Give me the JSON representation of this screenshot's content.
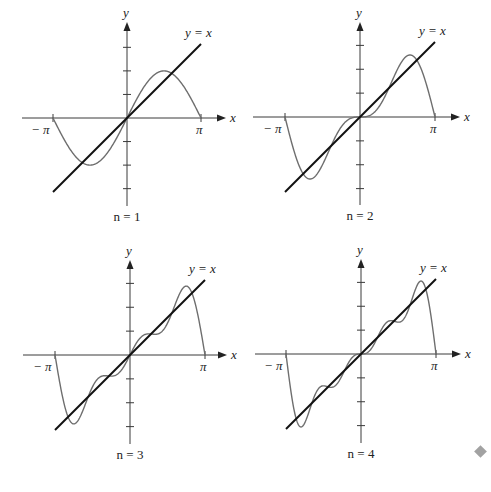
{
  "chart_data": [
    {
      "type": "line",
      "title": "n = 1",
      "n": 1,
      "xlabel": "x",
      "ylabel": "y",
      "x_tick_labels": [
        "−π",
        "π"
      ],
      "xlim": [
        -3.14159,
        3.14159
      ],
      "y_ticks": [
        -3,
        -2,
        -1,
        1,
        2,
        3
      ],
      "series": [
        {
          "name": "Fourier partial sum S_1(x) = 2 sin x",
          "terms": 1,
          "color": "#6e6e6e"
        },
        {
          "name": "y = x",
          "label": "y = x",
          "color": "#111111"
        }
      ],
      "annotations": [
        "y = x"
      ],
      "grid": false
    },
    {
      "type": "line",
      "title": "n = 2",
      "n": 2,
      "xlabel": "x",
      "ylabel": "y",
      "x_tick_labels": [
        "−π",
        "π"
      ],
      "xlim": [
        -3.14159,
        3.14159
      ],
      "y_ticks": [
        -3,
        -2,
        -1,
        1,
        2,
        3
      ],
      "series": [
        {
          "name": "Fourier partial sum S_2(x) = 2(sin x − sin 2x/2)",
          "terms": 2,
          "color": "#6e6e6e"
        },
        {
          "name": "y = x",
          "label": "y = x",
          "color": "#111111"
        }
      ],
      "annotations": [
        "y = x"
      ],
      "grid": false
    },
    {
      "type": "line",
      "title": "n = 3",
      "n": 3,
      "xlabel": "x",
      "ylabel": "y",
      "x_tick_labels": [
        "−π",
        "π"
      ],
      "xlim": [
        -3.14159,
        3.14159
      ],
      "y_ticks": [
        -3,
        -2,
        -1,
        1,
        2,
        3
      ],
      "series": [
        {
          "name": "Fourier partial sum S_3(x)",
          "terms": 3,
          "color": "#6e6e6e"
        },
        {
          "name": "y = x",
          "label": "y = x",
          "color": "#111111"
        }
      ],
      "annotations": [
        "y = x"
      ],
      "grid": false
    },
    {
      "type": "line",
      "title": "n = 4",
      "n": 4,
      "xlabel": "x",
      "ylabel": "y",
      "x_tick_labels": [
        "−π",
        "π"
      ],
      "xlim": [
        -3.14159,
        3.14159
      ],
      "y_ticks": [
        -3,
        -2,
        -1,
        1,
        2,
        3
      ],
      "series": [
        {
          "name": "Fourier partial sum S_4(x)",
          "terms": 4,
          "color": "#6e6e6e"
        },
        {
          "name": "y = x",
          "label": "y = x",
          "color": "#111111"
        }
      ],
      "annotations": [
        "y = x"
      ],
      "grid": false
    }
  ],
  "panels": [
    {
      "caption": "n = 1",
      "x_axis_label": "x",
      "y_axis_label": "y",
      "neg_pi_label": "− π",
      "pi_label": "π",
      "line_label": "y = x"
    },
    {
      "caption": "n = 2",
      "x_axis_label": "x",
      "y_axis_label": "y",
      "neg_pi_label": "− π",
      "pi_label": "π",
      "line_label": "y = x"
    },
    {
      "caption": "n = 3",
      "x_axis_label": "x",
      "y_axis_label": "y",
      "neg_pi_label": "− π",
      "pi_label": "π",
      "line_label": "y = x"
    },
    {
      "caption": "n = 4",
      "x_axis_label": "x",
      "y_axis_label": "y",
      "neg_pi_label": "− π",
      "pi_label": "π",
      "line_label": "y = x"
    }
  ],
  "end_marker": {
    "icon": "diamond-icon",
    "color": "#a2a2a2"
  }
}
